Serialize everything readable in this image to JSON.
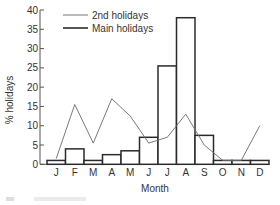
{
  "chart_data": {
    "type": "bar",
    "title": "",
    "xlabel": "Month",
    "ylabel": "% holidays",
    "ylim": [
      0,
      40
    ],
    "yticks": [
      0,
      5,
      10,
      15,
      20,
      25,
      30,
      35,
      40
    ],
    "categories": [
      "J",
      "F",
      "M",
      "A",
      "M",
      "J",
      "J",
      "A",
      "S",
      "O",
      "N",
      "D"
    ],
    "series": [
      {
        "name": "Main holidays",
        "kind": "bar",
        "values": [
          1,
          4,
          1,
          2.5,
          3.5,
          7,
          25.5,
          38,
          7.5,
          1,
          1,
          1
        ]
      },
      {
        "name": "2nd holidays",
        "kind": "line",
        "values": [
          1.5,
          15.5,
          5.5,
          17,
          12.5,
          5.5,
          7,
          13,
          5,
          1,
          1,
          10
        ]
      }
    ],
    "legend": {
      "position": "top-center",
      "entries": [
        "2nd holidays",
        "Main holidays"
      ]
    },
    "grid": false
  },
  "colors": {
    "bar_stroke": "#2b2b2b",
    "bar_fill": "#ffffff",
    "line": "#6a6a6a",
    "axis": "#555555",
    "text": "#333333"
  }
}
